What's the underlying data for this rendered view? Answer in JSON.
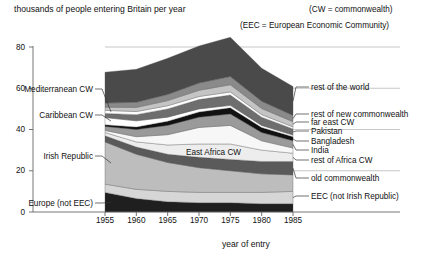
{
  "chart_data": {
    "type": "area",
    "title": "thousands of people entering Britain per year",
    "xlabel": "year of entry",
    "ylabel": "",
    "xlim": [
      1955,
      1985
    ],
    "ylim": [
      0,
      80
    ],
    "x": [
      1955,
      1960,
      1965,
      1970,
      1975,
      1980,
      1985
    ],
    "xticks": [
      "1955",
      "1960",
      "1965",
      "1970",
      "1975",
      "1980",
      "1985"
    ],
    "yticks": [
      "0",
      "20",
      "40",
      "60",
      "80"
    ],
    "grid": true,
    "legend_position": "inline-labels",
    "stacked": true,
    "notes": [
      "(CW = commonwealth)",
      "(EEC = European Economic Community)"
    ],
    "series": [
      {
        "name": "Europe (not EEC)",
        "label_side": "left",
        "color": "#1f1f1f",
        "values": [
          9.5,
          6.5,
          5.0,
          4.5,
          4.5,
          4.0,
          4.0
        ]
      },
      {
        "name": "EEC (not Irish Republic)",
        "label_side": "right",
        "color": "#d6d6d6",
        "values": [
          4.0,
          4.5,
          5.0,
          5.0,
          5.0,
          5.5,
          6.0
        ]
      },
      {
        "name": "Irish Republic",
        "label_side": "left",
        "color": "#bdbdbd",
        "values": [
          20.5,
          17.0,
          14.0,
          12.0,
          10.5,
          9.0,
          8.0
        ]
      },
      {
        "name": "old commonwealth",
        "label_side": "right",
        "color": "#5a5a5a",
        "values": [
          3.0,
          3.5,
          4.0,
          5.0,
          5.5,
          6.0,
          6.5
        ]
      },
      {
        "name": "rest of Africa CW",
        "label_side": "right",
        "color": "#ededed",
        "values": [
          1.5,
          2.5,
          4.5,
          6.5,
          7.5,
          5.5,
          4.0
        ]
      },
      {
        "name": "East Africa CW",
        "label_side": "inner",
        "color": "#f7f7f7",
        "values": [
          1.0,
          2.5,
          5.0,
          8.0,
          9.0,
          4.5,
          2.5
        ]
      },
      {
        "name": "India",
        "label_side": "right",
        "color": "#9a9a9a",
        "values": [
          2.0,
          3.5,
          4.5,
          5.0,
          5.5,
          4.0,
          3.5
        ]
      },
      {
        "name": "Bangladesh",
        "label_side": "right",
        "color": "#111111",
        "values": [
          0.8,
          1.2,
          2.0,
          2.5,
          3.0,
          2.5,
          2.0
        ]
      },
      {
        "name": "Caribbean CW",
        "label_side": "left",
        "color": "#ffffff",
        "values": [
          3.5,
          3.0,
          2.0,
          1.5,
          1.2,
          1.0,
          0.8
        ]
      },
      {
        "name": "Pakistan",
        "label_side": "right",
        "color": "#6e6e6e",
        "values": [
          2.0,
          3.0,
          4.0,
          4.5,
          5.0,
          4.0,
          3.0
        ]
      },
      {
        "name": "Mediterranean CW",
        "label_side": "left",
        "color": "#fdfdfd",
        "values": [
          1.5,
          1.5,
          1.5,
          1.5,
          1.5,
          1.2,
          1.0
        ]
      },
      {
        "name": "far east CW",
        "label_side": "right",
        "color": "#c4c4c4",
        "values": [
          1.5,
          2.0,
          2.5,
          3.0,
          3.5,
          3.0,
          2.5
        ]
      },
      {
        "name": "rest of new commonwealth",
        "label_side": "right",
        "color": "#8a8a8a",
        "values": [
          2.0,
          2.5,
          3.0,
          3.5,
          4.0,
          3.5,
          3.0
        ]
      },
      {
        "name": "rest of the world",
        "label_side": "right",
        "color": "#4a4a4a",
        "values": [
          15.0,
          16.0,
          17.5,
          18.0,
          19.0,
          16.0,
          14.0
        ]
      }
    ]
  }
}
